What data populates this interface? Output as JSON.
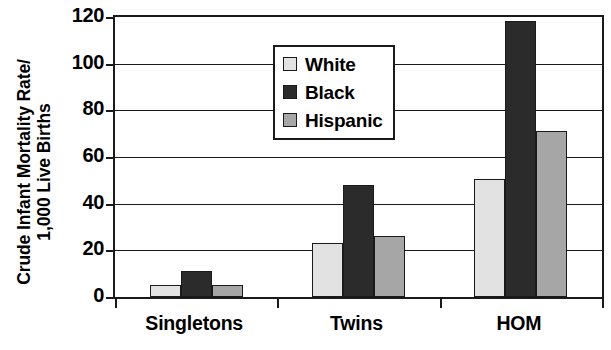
{
  "chart_data": {
    "type": "bar",
    "title": "",
    "xlabel": "",
    "ylabel": "Crude Infant Mortality Rate/ 1,000 Live Births",
    "ylabel_lines": [
      "Crude Infant Mortality Rate/",
      "1,000 Live Births"
    ],
    "categories": [
      "Singletons",
      "Twins",
      "HOM"
    ],
    "series": [
      {
        "name": "White",
        "color": "#e2e2e2",
        "values": [
          5,
          23,
          50.5
        ]
      },
      {
        "name": "Black",
        "color": "#2b2b2b",
        "values": [
          11,
          48,
          118.5
        ]
      },
      {
        "name": "Hispanic",
        "color": "#a6a6a6",
        "values": [
          5,
          26,
          71
        ]
      }
    ],
    "ylim": [
      0,
      120
    ],
    "yticks": [
      0,
      20,
      40,
      60,
      80,
      100,
      120
    ],
    "ytick_labels": [
      "0",
      "20",
      "40",
      "60",
      "80",
      "100",
      "120"
    ],
    "grid": true,
    "legend_position": "upper-left-inside"
  },
  "legend": {
    "items": [
      {
        "label": "White",
        "swatch": "series-white"
      },
      {
        "label": "Black",
        "swatch": "series-black"
      },
      {
        "label": "Hispanic",
        "swatch": "series-hispanic"
      }
    ]
  }
}
